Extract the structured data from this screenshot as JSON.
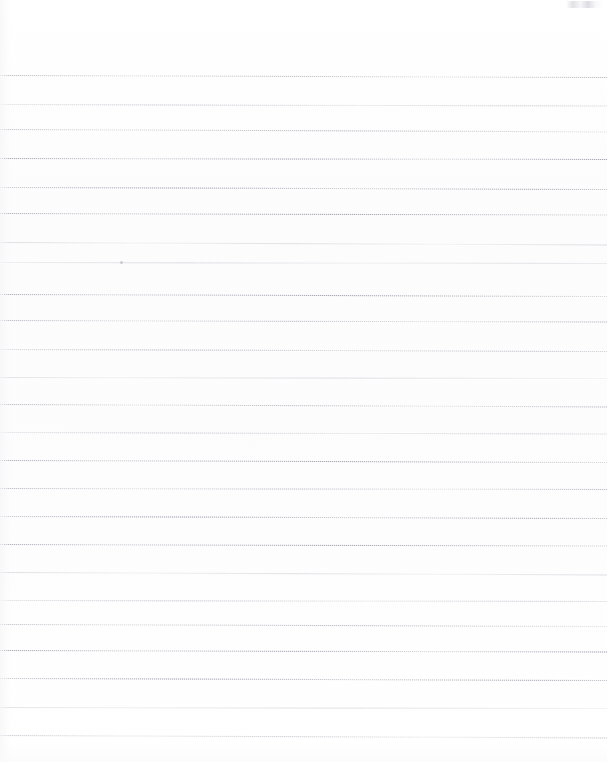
{
  "document": {
    "kind": "scanned-blank-ruled-page",
    "title": "",
    "visible_text": "",
    "background_color": "#ffffff",
    "rule_color": "#9696a2",
    "rule_ghost_color": "#babcc6",
    "page_width": 607,
    "page_height": 762,
    "rule_count": 24,
    "rule_spacing_px": 28.7,
    "first_rule_y": 75,
    "last_rule_y": 735,
    "rules_span_full_width": true,
    "left_margin_rule": false
  },
  "rules": [
    {
      "y": 75,
      "slope_px": 2.0,
      "ink": "ink-mid",
      "fade": "fade-a"
    },
    {
      "y": 104,
      "slope_px": 1.5,
      "ink": "ink-faint",
      "fade": "fade-b"
    },
    {
      "y": 129,
      "slope_px": 2.5,
      "ink": "ink-mid",
      "fade": "fade-c"
    },
    {
      "y": 158,
      "slope_px": 1.0,
      "ink": "ink-strong",
      "fade": "fade-a"
    },
    {
      "y": 187,
      "slope_px": 2.0,
      "ink": "ink-strong",
      "fade": "fade-b"
    },
    {
      "y": 213,
      "slope_px": 1.5,
      "ink": "ink-strong",
      "fade": "fade-c"
    },
    {
      "y": 242,
      "slope_px": 2.5,
      "ink": "ink-ghost",
      "fade": "fade-a"
    },
    {
      "y": 262,
      "slope_px": 1.0,
      "ink": "ink-ghost",
      "fade": "fade-b"
    },
    {
      "y": 294,
      "slope_px": 2.0,
      "ink": "ink-strong",
      "fade": "fade-c"
    },
    {
      "y": 320,
      "slope_px": 1.5,
      "ink": "ink-mid",
      "fade": "fade-a"
    },
    {
      "y": 349,
      "slope_px": 2.0,
      "ink": "ink-mid",
      "fade": "fade-b"
    },
    {
      "y": 377,
      "slope_px": 1.0,
      "ink": "ink-ghost",
      "fade": "fade-c"
    },
    {
      "y": 404,
      "slope_px": 2.5,
      "ink": "ink-mid",
      "fade": "fade-a"
    },
    {
      "y": 432,
      "slope_px": 1.5,
      "ink": "ink-faint",
      "fade": "fade-b"
    },
    {
      "y": 460,
      "slope_px": 2.0,
      "ink": "ink-strong",
      "fade": "fade-c"
    },
    {
      "y": 488,
      "slope_px": 1.0,
      "ink": "ink-mid",
      "fade": "fade-a"
    },
    {
      "y": 516,
      "slope_px": 2.0,
      "ink": "ink-strong",
      "fade": "fade-b"
    },
    {
      "y": 544,
      "slope_px": 1.5,
      "ink": "ink-strong",
      "fade": "fade-c"
    },
    {
      "y": 572,
      "slope_px": 2.5,
      "ink": "ink-ghost",
      "fade": "fade-a"
    },
    {
      "y": 600,
      "slope_px": 1.0,
      "ink": "ink-faint",
      "fade": "fade-b"
    },
    {
      "y": 624,
      "slope_px": 2.0,
      "ink": "ink-mid",
      "fade": "fade-c"
    },
    {
      "y": 650,
      "slope_px": 1.5,
      "ink": "ink-strong",
      "fade": "fade-a"
    },
    {
      "y": 678,
      "slope_px": 2.0,
      "ink": "ink-strong",
      "fade": "fade-b"
    },
    {
      "y": 707,
      "slope_px": 1.0,
      "ink": "ink-ghost",
      "fade": "fade-c"
    },
    {
      "y": 735,
      "slope_px": 2.5,
      "ink": "ink-faint",
      "fade": "fade-a"
    }
  ],
  "artifacts": [
    {
      "name": "smudge-top-right",
      "x": 566,
      "y": 1,
      "width": 38,
      "height": 7
    },
    {
      "name": "dust-speck",
      "x": 120,
      "y": 261,
      "width": 3,
      "height": 3
    }
  ]
}
